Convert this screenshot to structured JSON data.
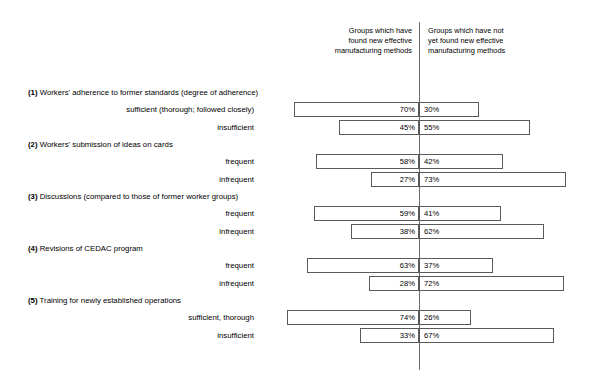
{
  "header": {
    "left_column": "Groups which have\nfound new effective\nmanufacturing methods",
    "right_column": "Groups which have not\nyet found new effective\nmanufacturing methods"
  },
  "chart_data": {
    "type": "bar",
    "title": "",
    "xlabel": "",
    "ylabel": "",
    "orientation": "horizontal",
    "stacked": true,
    "diverging": true,
    "axis_center": 0,
    "grid": false,
    "legend_position": "top",
    "series": [
      {
        "name": "Groups which have found new effective manufacturing methods",
        "values": [
          70,
          45,
          58,
          27,
          59,
          38,
          63,
          28,
          74,
          33
        ]
      },
      {
        "name": "Groups which have not yet found new effective manufacturing methods",
        "values": [
          30,
          55,
          42,
          73,
          41,
          62,
          37,
          72,
          26,
          67
        ]
      }
    ],
    "categories": [
      "sufficient (thorough; followed closely)",
      "insufficient",
      "frequent",
      "infrequent",
      "frequent",
      "infrequent",
      "frequent",
      "infrequent",
      "sufficient, thorough",
      "insufficient"
    ],
    "groups": [
      {
        "number": "(1)",
        "title": "Workers' adherence to former standards (degree of adherence)",
        "rows": [
          {
            "label": "sufficient (thorough; followed closely)",
            "left": 70,
            "right": 30,
            "left_text": "70%",
            "right_text": "30%"
          },
          {
            "label": "insufficient",
            "left": 45,
            "right": 55,
            "left_text": "45%",
            "right_text": "55%"
          }
        ]
      },
      {
        "number": "(2)",
        "title": "Workers' submission of ideas on cards",
        "rows": [
          {
            "label": "frequent",
            "left": 58,
            "right": 42,
            "left_text": "58%",
            "right_text": "42%"
          },
          {
            "label": "infrequent",
            "left": 27,
            "right": 73,
            "left_text": "27%",
            "right_text": "73%"
          }
        ]
      },
      {
        "number": "(3)",
        "title": "Discussions (compared to those of former worker groups)",
        "rows": [
          {
            "label": "frequent",
            "left": 59,
            "right": 41,
            "left_text": "59%",
            "right_text": "41%"
          },
          {
            "label": "infrequent",
            "left": 38,
            "right": 62,
            "left_text": "38%",
            "right_text": "62%"
          }
        ]
      },
      {
        "number": "(4)",
        "title": "Revisions of CEDAC program",
        "rows": [
          {
            "label": "frequent",
            "left": 63,
            "right": 37,
            "left_text": "63%",
            "right_text": "37%"
          },
          {
            "label": "infrequent",
            "left": 28,
            "right": 72,
            "left_text": "28%",
            "right_text": "72%"
          }
        ]
      },
      {
        "number": "(5)",
        "title": "Training for newly established operations",
        "rows": [
          {
            "label": "sufficient, thorough",
            "left": 74,
            "right": 26,
            "left_text": "74%",
            "right_text": "26%"
          },
          {
            "label": "insufficient",
            "left": 33,
            "right": 67,
            "left_text": "33%",
            "right_text": "67%"
          }
        ]
      }
    ]
  },
  "layout": {
    "left_scale_px_per_pct": 1.78,
    "right_scale_px_per_pct": 2.01,
    "row_height": 15,
    "group_title_offset": 14,
    "group_start_y": 88,
    "group_spacing": 52
  },
  "colors": {
    "bar_border": "#5a5a5a",
    "bar_fill": "#ffffff",
    "axis": "#6e6e6e",
    "text": "#000000",
    "background": "#ffffff"
  }
}
